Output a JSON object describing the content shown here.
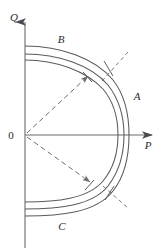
{
  "figure": {
    "kind": "pq-capability-curve-diagram",
    "background_color": "#ffffff",
    "line_color": "#5a5a5a",
    "dash_color": "#6b6b6b",
    "text_color": "#2b2b2b",
    "width": 164,
    "height": 252
  },
  "axes": {
    "vertical": {
      "name": "Q",
      "label": "Q",
      "arrow": "up-arrow-icon"
    },
    "horizontal": {
      "name": "P",
      "label": "P",
      "arrow": "right-arrow-icon"
    },
    "origin": {
      "label": "0",
      "x": 25,
      "y": 135
    }
  },
  "labels": {
    "origin": "0",
    "q_axis": "Q",
    "p_axis": "P",
    "curve_a": "A",
    "curve_b": "B",
    "curve_c": "C"
  },
  "curves": {
    "count": 3,
    "description": "three nested rounded capability boundary curves opening to the left",
    "segments": [
      {
        "name": "outer-curve",
        "top_y": 46,
        "bottom_y": 216,
        "apex_x": 129
      },
      {
        "name": "middle-curve",
        "top_y": 54,
        "bottom_y": 209,
        "apex_x": 124
      },
      {
        "name": "inner-curve",
        "top_y": 60,
        "bottom_y": 202,
        "apex_x": 118
      }
    ]
  },
  "dashed_rays": [
    {
      "name": "upper-ray",
      "angle_deg": -45,
      "arrowhead": true
    },
    {
      "name": "lower-ray",
      "angle_deg": 45,
      "arrowhead": true
    }
  ],
  "tick_marks": [
    {
      "name": "upper-tick",
      "x": 100,
      "y": 68
    },
    {
      "name": "lower-tick",
      "x": 101,
      "y": 190
    }
  ],
  "short_dashes": [
    {
      "name": "upper-short-dash"
    },
    {
      "name": "lower-short-dash"
    }
  ]
}
